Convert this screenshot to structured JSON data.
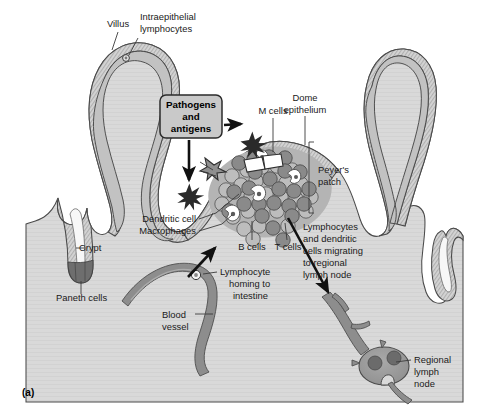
{
  "figure": {
    "panel_label": "(a)",
    "title_semantic": "Mucosal immune system of the small intestine: villi, crypt, Peyer's patch and regional lymph node",
    "background_color": "#ffffff",
    "canvas": {
      "width": 486,
      "height": 418
    }
  },
  "colors": {
    "page_background": "#ffffff",
    "lamina_propria": "#d9d9d9",
    "villus_core": "#c2c2c2",
    "epithelium_band": "#d0d0d0",
    "epithelium_stroke": "#4a4a4a",
    "crypt_lumen": "#f7f7f7",
    "paneth_cells": "#6e6e6e",
    "peyers_patch_fill": "#b4b4b4",
    "b_cell": "#b9b9b9",
    "t_cell": "#8a8a8a",
    "dendritic_cell": "#ffffff",
    "blood_vessel": "#8d8d8d",
    "lymph_vessel": "#8d8d8d",
    "lymph_node": "#9a9a9a",
    "lymph_node_follicle": "#6b6b6b",
    "pathogen_star": "#2a2a2a",
    "callout_box_fill": "#c9c9c9",
    "callout_box_stroke": "#2b2b2b",
    "text": "#1a1a1a",
    "leader_line": "#3a3a3a",
    "arrow": "#111111"
  },
  "callout": {
    "name": "pathogens-and-antigens",
    "lines": [
      "Pathogens",
      "and",
      "antigens"
    ],
    "shape": "rounded-rect"
  },
  "labels": [
    {
      "id": "villus",
      "text": "Villus",
      "lines": [
        "Villus"
      ],
      "x": 122,
      "y": 24,
      "anchor": "middle"
    },
    {
      "id": "iel",
      "text": "Intraepithelial lymphocytes",
      "lines": [
        "Intraepithelial",
        "lymphocytes"
      ],
      "x": 158,
      "y": 24,
      "anchor": "start"
    },
    {
      "id": "m-cells",
      "text": "M cells",
      "lines": [
        "M cells"
      ],
      "x": 265,
      "y": 111,
      "anchor": "start"
    },
    {
      "id": "dome-epi",
      "text": "Dome epithelium",
      "lines": [
        "Dome",
        "epithelium"
      ],
      "x": 300,
      "y": 100,
      "anchor": "start"
    },
    {
      "id": "peyers-patch",
      "text": "Peyer's patch",
      "lines": [
        "Peyer's",
        "patch"
      ],
      "x": 320,
      "y": 178,
      "anchor": "start"
    },
    {
      "id": "dendritic-cell",
      "text": "Dendritic cell",
      "lines": [
        "Dendritic cell"
      ],
      "x": 196,
      "y": 222,
      "anchor": "end"
    },
    {
      "id": "macrophages",
      "text": "Macrophages",
      "lines": [
        "Macrophages"
      ],
      "x": 196,
      "y": 234,
      "anchor": "end"
    },
    {
      "id": "b-cells",
      "text": "B cells",
      "lines": [
        "B cells"
      ],
      "x": 252,
      "y": 248,
      "anchor": "middle"
    },
    {
      "id": "t-cells",
      "text": "T cells",
      "lines": [
        "T cells"
      ],
      "x": 287,
      "y": 248,
      "anchor": "middle"
    },
    {
      "id": "migrating",
      "text": "Lymphocytes and dendritic cells migrating to regional lymph node",
      "lines": [
        "Lymphocytes",
        "and dendritic",
        "cells migrating",
        "to regional",
        "lymph node"
      ],
      "x": 303,
      "y": 230,
      "anchor": "start"
    },
    {
      "id": "crypt",
      "text": "Crypt",
      "lines": [
        "Crypt"
      ],
      "x": 79,
      "y": 251,
      "anchor": "start"
    },
    {
      "id": "paneth-cells",
      "text": "Paneth cells",
      "lines": [
        "Paneth cells"
      ],
      "x": 56,
      "y": 298,
      "anchor": "start"
    },
    {
      "id": "lymphocyte-homing",
      "text": "Lymphocyte homing to intestine",
      "lines": [
        "Lymphocyte",
        "homing to",
        "intestine"
      ],
      "x": 220,
      "y": 275,
      "anchor": "start"
    },
    {
      "id": "blood-vessel",
      "text": "Blood vessel",
      "lines": [
        "Blood",
        "vessel"
      ],
      "x": 162,
      "y": 318,
      "anchor": "start"
    },
    {
      "id": "regional-lymph-node",
      "text": "Regional lymph node",
      "lines": [
        "Regional",
        "lymph",
        "node"
      ],
      "x": 414,
      "y": 363,
      "anchor": "start"
    }
  ],
  "structures": {
    "villi_count": 3,
    "crypts_count": 2,
    "peyers_patch": {
      "b_cells_count": 24,
      "t_cells_count": 24,
      "dendritic_cells_count": 4
    },
    "pathogen_stars_count": 2,
    "m_cells_count": 2,
    "intraepithelial_lymphocytes_count": 1,
    "lymph_node_follicles_count": 2
  }
}
